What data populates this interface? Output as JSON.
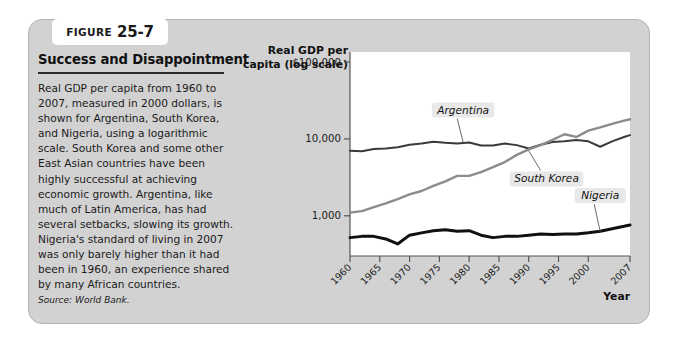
{
  "figure": {
    "tag_word": "FIGURE",
    "tag_number": "25-7",
    "title": "Success and Disappointment",
    "body": "Real GDP per capita from 1960 to 2007, measured in 2000 dollars, is shown for Argentina, South Korea, and Nigeria, using a logarithmic scale. South Korea and some other East Asian countries have been highly successful at achieving economic growth. Argentina, like much of Latin America, has had several setbacks, slowing its growth. Nigeria's standard of living in 2007 was only barely higher than it had been in 1960, an experience shared by many African countries.",
    "source": "Source: World Bank."
  },
  "chart_data": {
    "type": "line",
    "title": "Success and Disappointment",
    "ylabel": "Real GDP per capita (log scale)",
    "xlabel": "Year",
    "scale": "log",
    "grid": false,
    "legend_position": "inline-annotations",
    "ylim": [
      300,
      100000
    ],
    "xlim": [
      1960,
      2007
    ],
    "ytick_labels": [
      "$100,000",
      "10,000",
      "1,000"
    ],
    "ytick_values": [
      100000,
      10000,
      1000
    ],
    "xtick_labels": [
      "1960",
      "1965",
      "1970",
      "1975",
      "1980",
      "1985",
      "1990",
      "1995",
      "2000",
      "2007"
    ],
    "xtick_values": [
      1960,
      1965,
      1970,
      1975,
      1980,
      1985,
      1990,
      1995,
      2000,
      2007
    ],
    "x": [
      1960,
      1962,
      1964,
      1966,
      1968,
      1970,
      1972,
      1974,
      1976,
      1978,
      1980,
      1982,
      1984,
      1986,
      1988,
      1990,
      1992,
      1994,
      1996,
      1998,
      2000,
      2002,
      2004,
      2006,
      2007
    ],
    "series": [
      {
        "name": "Argentina",
        "color": "#3a3a3a",
        "values": [
          7000,
          6900,
          7400,
          7500,
          7800,
          8400,
          8700,
          9200,
          8900,
          8700,
          9000,
          8200,
          8200,
          8700,
          8300,
          7500,
          8400,
          9100,
          9300,
          9700,
          9300,
          7900,
          9300,
          10600,
          11200
        ]
      },
      {
        "name": "South Korea",
        "color": "#8c8c8c",
        "values": [
          1100,
          1150,
          1300,
          1450,
          1650,
          1900,
          2100,
          2450,
          2800,
          3300,
          3300,
          3700,
          4300,
          5000,
          6200,
          7300,
          8300,
          9700,
          11500,
          10600,
          12800,
          14100,
          15700,
          17300,
          18000
        ]
      },
      {
        "name": "Nigeria",
        "color": "#101010",
        "values": [
          520,
          540,
          540,
          500,
          430,
          560,
          600,
          640,
          660,
          630,
          640,
          560,
          520,
          540,
          540,
          560,
          580,
          570,
          580,
          580,
          600,
          630,
          680,
          730,
          760
        ]
      }
    ],
    "annotations": [
      {
        "text": "Argentina",
        "x": 1979,
        "y": 22000
      },
      {
        "text": "South Korea",
        "x": 1993,
        "y": 2800
      },
      {
        "text": "Nigeria",
        "x": 2002,
        "y": 1700
      }
    ]
  }
}
